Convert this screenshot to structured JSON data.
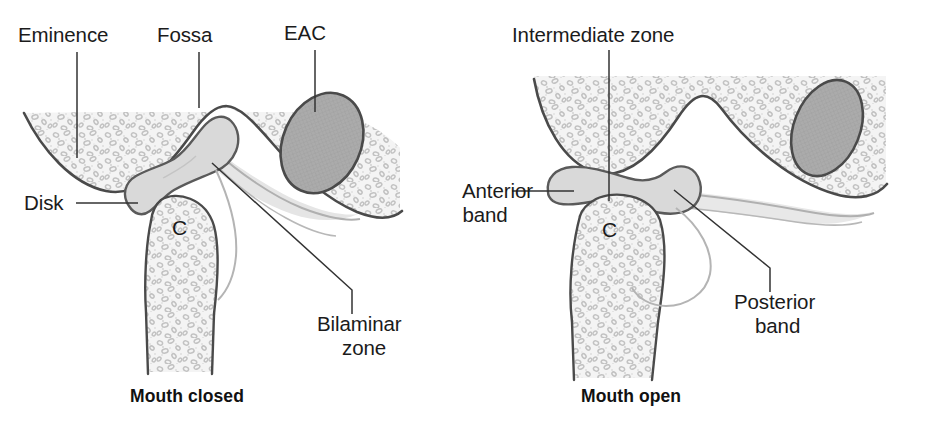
{
  "figure": {
    "background_color": "#ffffff",
    "line_color": "#3a3a3a",
    "soft_line_color": "#9a9a9a",
    "bone_fill": "#f2f2f2",
    "disk_fill": "#d8d8d8",
    "eac_fill": "#a9a9a9",
    "bilaminar_fill": "#e8e8e8",
    "text_color": "#1b1b1b"
  },
  "panels": [
    {
      "id": "mouth-closed",
      "caption": "Mouth closed",
      "condyle_letter": "C",
      "labels": [
        {
          "id": "eminence",
          "text": "Eminence"
        },
        {
          "id": "fossa",
          "text": "Fossa"
        },
        {
          "id": "eac",
          "text": "EAC"
        },
        {
          "id": "disk",
          "text": "Disk"
        },
        {
          "id": "bilaminar-1",
          "text": "Bilaminar"
        },
        {
          "id": "bilaminar-2",
          "text": "zone"
        }
      ]
    },
    {
      "id": "mouth-open",
      "caption": "Mouth open",
      "condyle_letter": "C",
      "labels": [
        {
          "id": "intermediate-zone",
          "text": "Intermediate zone"
        },
        {
          "id": "anterior-1",
          "text": "Anterior"
        },
        {
          "id": "anterior-2",
          "text": "band"
        },
        {
          "id": "posterior-1",
          "text": "Posterior"
        },
        {
          "id": "posterior-2",
          "text": "band"
        }
      ]
    }
  ]
}
